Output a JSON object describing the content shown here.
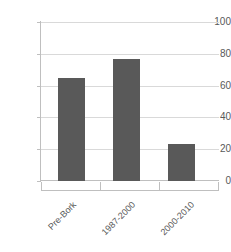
{
  "chart_data": {
    "type": "bar",
    "title": "",
    "subtitle": "",
    "xlabel": "",
    "ylabel": "",
    "categories": [
      "Pre-Bork",
      "1987-2000",
      "2000-2010"
    ],
    "values": [
      65,
      77,
      23
    ],
    "series": [
      {
        "name": "",
        "values": [
          65,
          77,
          23
        ]
      }
    ],
    "ylim": [
      0,
      100
    ],
    "y_ticks": [
      0,
      20,
      40,
      60,
      80,
      100
    ],
    "y_tick_labels": [
      "0",
      "20",
      "40",
      "60",
      "80",
      "100"
    ],
    "grid": true,
    "grid_axis": "y",
    "legend": false,
    "legend_position": "none",
    "annotations": [],
    "x_tick_label_rotation": -45
  },
  "style": {
    "bar_color": "#595959",
    "gridline_color": "#d9d9d9",
    "axis_color": "#bfbfbf",
    "tick_label_color": "#595959",
    "background_color": "#ffffff"
  }
}
